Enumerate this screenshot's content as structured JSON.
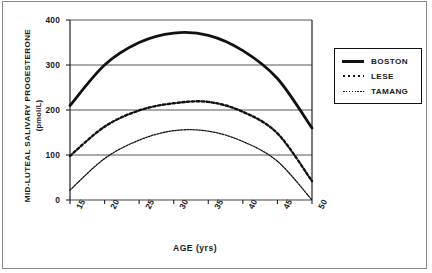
{
  "figure": {
    "axis_titles": {
      "y_main": "MID-LUTEAL SALIVARY PROGESTERONE",
      "y_unit": "(pmol/L)",
      "x": "AGE (yrs)"
    }
  },
  "legend": {
    "items": [
      {
        "label": "BOSTON",
        "style": "solid"
      },
      {
        "label": "LESE",
        "style": "dotted"
      },
      {
        "label": "TAMANG",
        "style": "fine"
      }
    ]
  },
  "chart_data": {
    "type": "line",
    "title": "",
    "xlabel": "AGE (yrs)",
    "ylabel": "MID-LUTEAL SALIVARY PROGESTERONE (pmol/L)",
    "xlim": [
      15,
      50
    ],
    "ylim": [
      0,
      400
    ],
    "xticks": [
      15,
      20,
      25,
      30,
      35,
      40,
      45,
      50
    ],
    "yticks": [
      0,
      100,
      200,
      300,
      400
    ],
    "grid": "horizontal",
    "legend_position": "right-outside",
    "x": [
      15,
      20,
      25,
      30,
      35,
      40,
      45,
      50
    ],
    "series": [
      {
        "name": "BOSTON",
        "style": "solid",
        "color": "#111111",
        "peak_x": 31,
        "peak_y": 372,
        "values": [
          210,
          300,
          350,
          371,
          366,
          332,
          270,
          160
        ]
      },
      {
        "name": "LESE",
        "style": "dotted",
        "color": "#111111",
        "peak_x": 32,
        "peak_y": 218,
        "values": [
          98,
          163,
          199,
          215,
          218,
          196,
          148,
          42
        ]
      },
      {
        "name": "TAMANG",
        "style": "fine",
        "color": "#111111",
        "peak_x": 31,
        "peak_y": 155,
        "values": [
          22,
          92,
          133,
          154,
          153,
          130,
          86,
          0
        ]
      }
    ]
  }
}
